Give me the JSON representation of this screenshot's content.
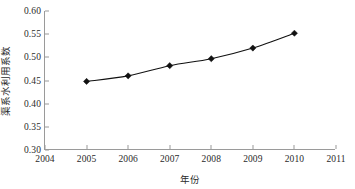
{
  "chart_data": {
    "type": "line",
    "title": "",
    "xlabel": "年份",
    "ylabel": "渠系水利用系数",
    "x": [
      2005,
      2006,
      2007,
      2008,
      2009,
      2010
    ],
    "values": [
      0.448,
      0.46,
      0.482,
      0.497,
      0.52,
      0.552
    ],
    "series": [
      {
        "name": "渠系水利用系数",
        "values": [
          0.448,
          0.46,
          0.482,
          0.497,
          0.52,
          0.552
        ]
      }
    ],
    "xlim": [
      2004,
      2011
    ],
    "ylim": [
      0.3,
      0.6
    ],
    "xticks": [
      2004,
      2005,
      2006,
      2007,
      2008,
      2009,
      2010,
      2011
    ],
    "xtick_labels": [
      "2004",
      "2005",
      "2006",
      "2007",
      "2008",
      "2009",
      "2010",
      "2011"
    ],
    "yticks": [
      0.3,
      0.35,
      0.4,
      0.45,
      0.5,
      0.55,
      0.6
    ],
    "ytick_labels": [
      "0.30",
      "0.35",
      "0.40",
      "0.45",
      "0.50",
      "0.55",
      "0.60"
    ],
    "grid": false,
    "legend": false,
    "marker": "diamond",
    "line_color": "#111111",
    "marker_color": "#111111",
    "axis_color": "#9a9a9a",
    "background": "#ffffff"
  }
}
